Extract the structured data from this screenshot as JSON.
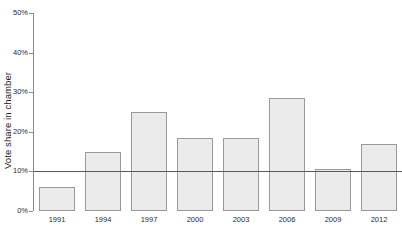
{
  "chart_data": {
    "type": "bar",
    "title": "",
    "subtitle": "",
    "xlabel": "",
    "ylabel": "Vote share in chamber",
    "categories": [
      "1991",
      "1994",
      "1997",
      "2000",
      "2003",
      "2006",
      "2009",
      "2012"
    ],
    "values": [
      6,
      15,
      25,
      18.5,
      18.5,
      28.5,
      10.5,
      17
    ],
    "ylim": [
      0,
      50
    ],
    "yticks": [
      0,
      10,
      20,
      30,
      40,
      50
    ],
    "ytick_labels": [
      "0%",
      "10%",
      "20%",
      "30%",
      "40%",
      "50%"
    ],
    "grid": false,
    "legend": false,
    "legend_position": "none",
    "annotations": [
      {
        "name": "reference-line",
        "type": "hline",
        "value": 10,
        "label": ""
      }
    ],
    "series": [
      {
        "name": "Vote share in chamber",
        "values": [
          6,
          15,
          25,
          18.5,
          18.5,
          28.5,
          10.5,
          17
        ]
      }
    ],
    "colors": {
      "bar_fill": "#ebebeb",
      "bar_stroke": "#9a9a9a",
      "axis": "#8a8a8a",
      "reference_line": "#5a5a5a",
      "text": "#2b2b2b",
      "background": "#ffffff"
    }
  }
}
